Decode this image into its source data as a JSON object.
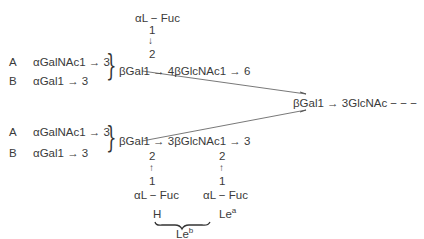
{
  "diagram": {
    "title": "",
    "upper": {
      "fuc_label": "αL − Fuc",
      "num1": "1",
      "arrow_down": "↓",
      "num2": "2",
      "row_A_label": "A",
      "row_A_sugar": "αGalNAc1 → 3",
      "row_B_label": "B",
      "row_B_sugar": "αGal1 → 3",
      "chain": "βGal1 → 4βGlcNAc1 → 6"
    },
    "core": {
      "label": "βGal1 → 3GlcNAc − − −"
    },
    "lower": {
      "row_A_label": "A",
      "row_A_sugar": "αGalNAc1 → 3",
      "row_B_label": "B",
      "row_B_sugar": "αGal1 → 3",
      "chain": "βGal1 → 3βGlcNAc1 → 3",
      "left_branch": {
        "num2": "2",
        "arrow_up": "↑",
        "num1": "1",
        "fuc": "αL − Fuc"
      },
      "right_branch": {
        "num2": "2",
        "arrow_up": "↑",
        "num1": "1",
        "fuc": "αL − Fuc"
      },
      "H_label": "H",
      "Lea_base": "Le",
      "Lea_sup": "a",
      "Leb_base": "Le",
      "Leb_sup": "b"
    }
  }
}
